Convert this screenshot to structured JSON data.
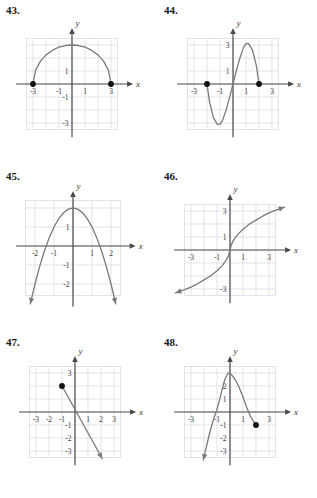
{
  "page": {
    "background": "#ffffff",
    "grid_color": "#d9d6e0",
    "axis_color": "#4a4a4a",
    "curve_color": "#7a7a7a",
    "point_color": "#111111",
    "text_color": "#2b2b2b"
  },
  "problems": [
    {
      "number": "43.",
      "position": {
        "left": 0,
        "top": 0
      },
      "axis_labels": {
        "x": "x",
        "y": "y"
      },
      "x_ticks": [
        "-3",
        "-1",
        "1",
        "3"
      ],
      "y_ticks": [
        "1",
        "-1",
        "-3"
      ],
      "chart_data": {
        "type": "line",
        "title": "43.",
        "xlabel": "x",
        "ylabel": "y",
        "xlim": [
          -4.5,
          4.5
        ],
        "ylim": [
          -4.5,
          4.5
        ],
        "grid": true,
        "description": "Upper semicircle of radius 3 centered at origin",
        "series": [
          {
            "name": "semicircle",
            "points": [
              [
                -3,
                0
              ],
              [
                -2.8,
                1.07
              ],
              [
                -2.4,
                1.8
              ],
              [
                -2,
                2.24
              ],
              [
                -1.5,
                2.6
              ],
              [
                -1,
                2.83
              ],
              [
                -0.5,
                2.96
              ],
              [
                0,
                3
              ],
              [
                0.5,
                2.96
              ],
              [
                1,
                2.83
              ],
              [
                1.5,
                2.6
              ],
              [
                2,
                2.24
              ],
              [
                2.4,
                1.8
              ],
              [
                2.8,
                1.07
              ],
              [
                3,
                0
              ]
            ]
          }
        ],
        "endpoints_filled": [
          [
            -3,
            0
          ],
          [
            3,
            0
          ]
        ],
        "arrows": []
      }
    },
    {
      "number": "44.",
      "position": {
        "left": 158,
        "top": 0
      },
      "axis_labels": {
        "x": "x",
        "y": "y"
      },
      "x_ticks": [
        "-3",
        "-1",
        "1",
        "3"
      ],
      "y_ticks": [
        "3",
        "1"
      ],
      "chart_data": {
        "type": "line",
        "title": "44.",
        "xlabel": "x",
        "ylabel": "y",
        "xlim": [
          -4.5,
          4.5
        ],
        "ylim": [
          -4.5,
          4.5
        ],
        "grid": true,
        "description": "Cubic curve with zeros at -2, 0, 2; local minimum near (-1,-3), local maximum near (1,3)",
        "series": [
          {
            "name": "cubic",
            "points": [
              [
                -2,
                0
              ],
              [
                -1.8,
                -1.4
              ],
              [
                -1.5,
                -2.6
              ],
              [
                -1.2,
                -3.1
              ],
              [
                -1,
                -3.1
              ],
              [
                -0.8,
                -2.8
              ],
              [
                -0.5,
                -1.9
              ],
              [
                -0.2,
                -0.8
              ],
              [
                0,
                0
              ],
              [
                0.2,
                0.8
              ],
              [
                0.5,
                1.9
              ],
              [
                0.8,
                2.8
              ],
              [
                1,
                3.1
              ],
              [
                1.2,
                3.1
              ],
              [
                1.5,
                2.6
              ],
              [
                1.8,
                1.4
              ],
              [
                2,
                0
              ]
            ]
          }
        ],
        "endpoints_filled": [
          [
            -2,
            0
          ],
          [
            2,
            0
          ]
        ],
        "arrows": []
      }
    },
    {
      "number": "45.",
      "position": {
        "left": 0,
        "top": 166
      },
      "axis_labels": {
        "x": "x",
        "y": "y"
      },
      "x_ticks": [
        "-2",
        "-1",
        "1",
        "2"
      ],
      "y_ticks": [
        "1",
        "-1",
        "-2"
      ],
      "chart_data": {
        "type": "line",
        "title": "45.",
        "xlabel": "x",
        "ylabel": "y",
        "xlim": [
          -3,
          3
        ],
        "ylim": [
          -3.2,
          2.8
        ],
        "grid": true,
        "description": "Downward-opening parabola with vertex at (0,2), arrows pointing down at both ends",
        "series": [
          {
            "name": "parabola",
            "points": [
              [
                -2.25,
                -3.05
              ],
              [
                -2,
                -2
              ],
              [
                -1.75,
                -1.06
              ],
              [
                -1.5,
                -0.25
              ],
              [
                -1.25,
                0.44
              ],
              [
                -1,
                1
              ],
              [
                -0.75,
                1.44
              ],
              [
                -0.5,
                1.75
              ],
              [
                -0.25,
                1.94
              ],
              [
                0,
                2
              ],
              [
                0.25,
                1.94
              ],
              [
                0.5,
                1.75
              ],
              [
                0.75,
                1.44
              ],
              [
                1,
                1
              ],
              [
                1.25,
                0.44
              ],
              [
                1.5,
                -0.25
              ],
              [
                1.75,
                -1.06
              ],
              [
                2,
                -2
              ],
              [
                2.25,
                -3.05
              ]
            ]
          }
        ],
        "endpoints_filled": [],
        "arrows": [
          [
            -2.25,
            -3.05
          ],
          [
            2.25,
            -3.05
          ]
        ]
      }
    },
    {
      "number": "46.",
      "position": {
        "left": 158,
        "top": 166
      },
      "axis_labels": {
        "x": "x",
        "y": "y"
      },
      "x_ticks": [
        "-3",
        "-1",
        "1",
        "3"
      ],
      "y_ticks": [
        "3",
        "1",
        "-3"
      ],
      "chart_data": {
        "type": "line",
        "title": "46.",
        "xlabel": "x",
        "ylabel": "y",
        "xlim": [
          -4.5,
          4.5
        ],
        "ylim": [
          -4.5,
          4.5
        ],
        "grid": true,
        "description": "Cube-root shaped increasing curve through the origin, arrows at both ends",
        "series": [
          {
            "name": "cube-root",
            "points": [
              [
                -4.2,
                -3.3
              ],
              [
                -3.5,
                -3.05
              ],
              [
                -3,
                -2.85
              ],
              [
                -2.5,
                -2.6
              ],
              [
                -2,
                -2.3
              ],
              [
                -1.5,
                -2.0
              ],
              [
                -1,
                -1.6
              ],
              [
                -0.6,
                -1.2
              ],
              [
                -0.3,
                -0.8
              ],
              [
                -0.12,
                -0.45
              ],
              [
                0,
                0
              ],
              [
                0.12,
                0.45
              ],
              [
                0.3,
                0.8
              ],
              [
                0.6,
                1.2
              ],
              [
                1,
                1.6
              ],
              [
                1.5,
                2.0
              ],
              [
                2,
                2.3
              ],
              [
                2.5,
                2.6
              ],
              [
                3,
                2.85
              ],
              [
                3.5,
                3.05
              ],
              [
                4.2,
                3.3
              ]
            ]
          }
        ],
        "endpoints_filled": [],
        "arrows": [
          [
            -4.2,
            -3.3
          ],
          [
            4.2,
            3.3
          ]
        ]
      }
    },
    {
      "number": "47.",
      "position": {
        "left": 0,
        "top": 332
      },
      "axis_labels": {
        "x": "x",
        "y": "y"
      },
      "x_ticks": [
        "-3",
        "-2",
        "-1",
        "1",
        "2",
        "3"
      ],
      "y_ticks": [
        "3",
        "-1",
        "-2",
        "-3"
      ],
      "chart_data": {
        "type": "line",
        "title": "47.",
        "xlabel": "x",
        "ylabel": "y",
        "xlim": [
          -4.5,
          4.5
        ],
        "ylim": [
          -4.5,
          4.5
        ],
        "grid": true,
        "description": "Ray beginning at filled point (-1,2) and descending to the right with arrow near (2,-3.5)",
        "series": [
          {
            "name": "ray",
            "points": [
              [
                -1,
                2
              ],
              [
                2.1,
                -3.6
              ]
            ]
          }
        ],
        "endpoints_filled": [
          [
            -1,
            2
          ]
        ],
        "arrows": [
          [
            2.1,
            -3.6
          ]
        ]
      }
    },
    {
      "number": "48.",
      "position": {
        "left": 158,
        "top": 332
      },
      "axis_labels": {
        "x": "x",
        "y": "y"
      },
      "x_ticks": [
        "-3",
        "-1",
        "1",
        "3"
      ],
      "y_ticks": [
        "2",
        "1",
        "-1",
        "-2",
        "-3"
      ],
      "chart_data": {
        "type": "line",
        "title": "48.",
        "xlabel": "x",
        "ylabel": "y",
        "xlim": [
          -4.5,
          4.5
        ],
        "ylim": [
          -4.5,
          4.5
        ],
        "grid": true,
        "description": "Downward parabola with vertex near (-0.15,3); arrow at lower left, filled endpoint at (2,-1)",
        "series": [
          {
            "name": "parabola-arc",
            "points": [
              [
                -2.05,
                -3.7
              ],
              [
                -1.8,
                -2.6
              ],
              [
                -1.6,
                -1.75
              ],
              [
                -1.4,
                -1.0
              ],
              [
                -1.2,
                -0.35
              ],
              [
                -1,
                0.2
              ],
              [
                -0.8,
                0.95
              ],
              [
                -0.6,
                1.75
              ],
              [
                -0.4,
                2.5
              ],
              [
                -0.15,
                3.0
              ],
              [
                0.1,
                2.9
              ],
              [
                0.4,
                2.5
              ],
              [
                0.7,
                1.9
              ],
              [
                1,
                1.15
              ],
              [
                1.3,
                0.3
              ],
              [
                1.6,
                -0.4
              ],
              [
                2,
                -1
              ]
            ]
          }
        ],
        "endpoints_filled": [
          [
            2,
            -1
          ]
        ],
        "arrows": [
          [
            -2.05,
            -3.7
          ]
        ]
      }
    }
  ]
}
